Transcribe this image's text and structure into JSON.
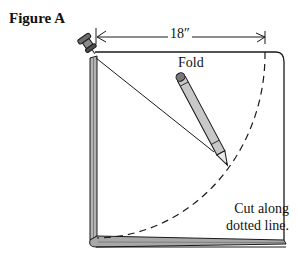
{
  "figure": {
    "title": "Figure A",
    "dimension_label": "18″",
    "fold_label": "Fold",
    "instruction_lines": [
      "Cut along",
      "dotted line."
    ]
  },
  "elements": {
    "pushpin": "pushpin-icon",
    "pencil": "pencil-icon",
    "string": "string-line",
    "cut_line": "dashed-arc",
    "fabric": "folded-fabric"
  },
  "colors": {
    "ink": "#1a1a1a",
    "fabric_edge_gray": "#9a9a9a",
    "pencil_body": "#c8c8c8",
    "background": "#ffffff"
  }
}
